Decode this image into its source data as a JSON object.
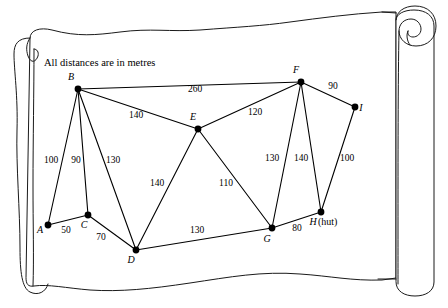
{
  "figure": {
    "caption": "All distances are in metres",
    "nodes": [
      {
        "id": "A",
        "label": "A",
        "suffix": "",
        "x": 48,
        "y": 225,
        "lx": 40,
        "ly": 233
      },
      {
        "id": "B",
        "label": "B",
        "suffix": "",
        "x": 78,
        "y": 89,
        "lx": 71,
        "ly": 80
      },
      {
        "id": "C",
        "label": "C",
        "suffix": "",
        "x": 88,
        "y": 215,
        "lx": 84,
        "ly": 228
      },
      {
        "id": "D",
        "label": "D",
        "suffix": "",
        "x": 136,
        "y": 250,
        "lx": 131,
        "ly": 263
      },
      {
        "id": "E",
        "label": "E",
        "suffix": "",
        "x": 198,
        "y": 129,
        "lx": 193,
        "ly": 120
      },
      {
        "id": "F",
        "label": "F",
        "suffix": "",
        "x": 301,
        "y": 82,
        "lx": 296,
        "ly": 73
      },
      {
        "id": "G",
        "label": "G",
        "suffix": "",
        "x": 272,
        "y": 228,
        "lx": 267,
        "ly": 242
      },
      {
        "id": "H",
        "label": "H",
        "suffix": " (hut)",
        "x": 321,
        "y": 212,
        "lx": 313,
        "ly": 225
      },
      {
        "id": "I",
        "label": "I",
        "suffix": "",
        "x": 355,
        "y": 107,
        "lx": 361,
        "ly": 111
      }
    ],
    "edges": [
      {
        "from": "A",
        "to": "B",
        "weight": "100",
        "lx": 51,
        "ly": 163
      },
      {
        "from": "A",
        "to": "C",
        "weight": "50",
        "lx": 66,
        "ly": 233
      },
      {
        "from": "B",
        "to": "C",
        "weight": "90",
        "lx": 76,
        "ly": 163
      },
      {
        "from": "B",
        "to": "D",
        "weight": "130",
        "lx": 113,
        "ly": 163
      },
      {
        "from": "B",
        "to": "E",
        "weight": "140",
        "lx": 136,
        "ly": 118
      },
      {
        "from": "B",
        "to": "F",
        "weight": "260",
        "lx": 195,
        "ly": 92
      },
      {
        "from": "C",
        "to": "D",
        "weight": "70",
        "lx": 101,
        "ly": 240
      },
      {
        "from": "D",
        "to": "E",
        "weight": "140",
        "lx": 157,
        "ly": 186
      },
      {
        "from": "D",
        "to": "G",
        "weight": "130",
        "lx": 197,
        "ly": 233
      },
      {
        "from": "E",
        "to": "F",
        "weight": "120",
        "lx": 255,
        "ly": 115
      },
      {
        "from": "E",
        "to": "G",
        "weight": "110",
        "lx": 226,
        "ly": 186
      },
      {
        "from": "F",
        "to": "G",
        "weight": "130",
        "lx": 272,
        "ly": 161
      },
      {
        "from": "F",
        "to": "H",
        "weight": "140",
        "lx": 301,
        "ly": 161
      },
      {
        "from": "F",
        "to": "I",
        "weight": "90",
        "lx": 333,
        "ly": 89
      },
      {
        "from": "G",
        "to": "H",
        "weight": "80",
        "lx": 297,
        "ly": 231
      },
      {
        "from": "H",
        "to": "I",
        "weight": "100",
        "lx": 347,
        "ly": 161
      }
    ]
  }
}
